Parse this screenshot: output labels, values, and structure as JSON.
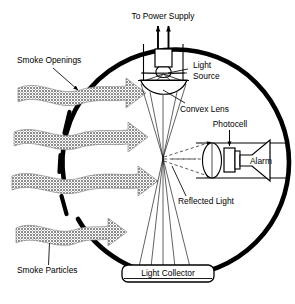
{
  "diagram": {
    "title_label": "To Power Supply",
    "labels": {
      "power_supply": "To Power Supply",
      "smoke_openings": "Smoke Openings",
      "light_source": "Light",
      "light_source_2": "Source",
      "convex_lens": "Convex Lens",
      "photocell": "Photocell",
      "alarm": "Alarm",
      "reflected_light": "Reflected Light",
      "smoke_particles": "Smoke Particles",
      "light_collector": "Light Collector"
    },
    "colors": {
      "outline": "#000000",
      "smoke_arrow_fill": "#8c8c8c",
      "background": "#ffffff",
      "thin_line": "#1a1a1a"
    },
    "components": [
      {
        "name": "power-supply-arrows",
        "count": 2
      },
      {
        "name": "light-source-bulb"
      },
      {
        "name": "convex-lens"
      },
      {
        "name": "light-collector"
      },
      {
        "name": "photocell"
      },
      {
        "name": "alarm-horn"
      },
      {
        "name": "photocell-lens"
      },
      {
        "name": "detector-housing"
      }
    ],
    "smoke_arrows": [
      {
        "index": 1,
        "y": 96
      },
      {
        "index": 2,
        "y": 140
      },
      {
        "index": 3,
        "y": 184
      },
      {
        "index": 4,
        "y": 235
      }
    ],
    "wall_dashes": 4
  }
}
